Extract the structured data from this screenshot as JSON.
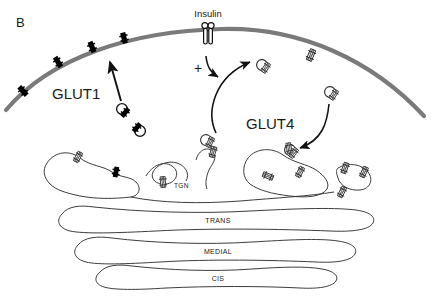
{
  "figure": {
    "panel_label": "B",
    "kind": "cell-biology-schematic",
    "background_color": "#ffffff",
    "ink_color": "#1a1a1a",
    "membrane_color": "#7a7a7a",
    "glut1_color": "#000000",
    "glut4_color": "#ffffff"
  },
  "labels": {
    "glut1": "GLUT1",
    "glut4": "GLUT4",
    "insulin": "Insulin",
    "plus": "+"
  },
  "cisternae": [
    {
      "name": "tgn",
      "label": "TGN"
    },
    {
      "name": "trans",
      "label": "TRANS"
    },
    {
      "name": "medial",
      "label": "MEDIAL"
    },
    {
      "name": "cis",
      "label": "CIS"
    }
  ],
  "membrane": {
    "glut1_transporters": 4,
    "glut4_transporters": 1,
    "insulin_receptors": 1
  },
  "vesicles": {
    "glut1_count": 2,
    "glut4_count": 4
  },
  "arrows": {
    "glut1_to_membrane": 1,
    "insulin_signal": 1,
    "glut4_exocytosis": 1,
    "glut4_endocytosis": 1
  }
}
